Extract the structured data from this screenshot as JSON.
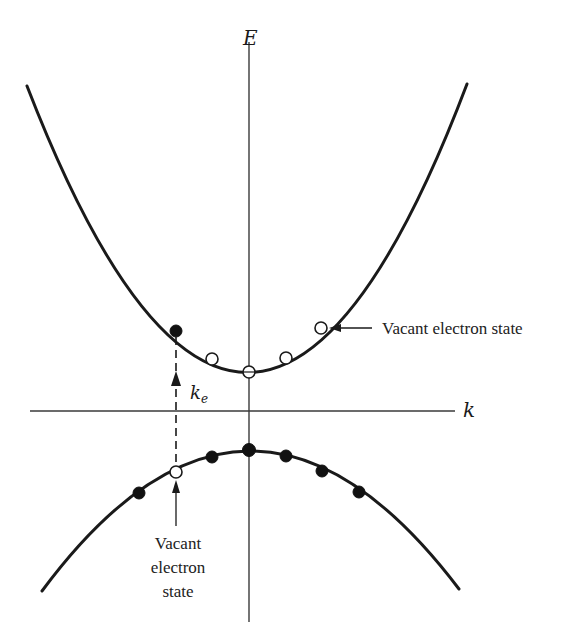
{
  "diagram": {
    "axes": {
      "vertical_label": "E",
      "horizontal_label": "k"
    },
    "wavevector_label": {
      "main": "k",
      "subscript": "e"
    },
    "annotations": {
      "upper_vacant": "Vacant electron state",
      "lower_vacant_line1": "Vacant",
      "lower_vacant_line2": "electron",
      "lower_vacant_line3": "state"
    },
    "conduction_band_points": [
      {
        "x": 176,
        "y": 331,
        "state": "filled"
      },
      {
        "x": 212,
        "y": 359,
        "state": "vacant"
      },
      {
        "x": 249,
        "y": 372,
        "state": "vacant"
      },
      {
        "x": 286,
        "y": 358,
        "state": "vacant"
      },
      {
        "x": 321,
        "y": 328,
        "state": "vacant"
      }
    ],
    "valence_band_points": [
      {
        "x": 139,
        "y": 493,
        "state": "filled"
      },
      {
        "x": 176,
        "y": 472,
        "state": "vacant"
      },
      {
        "x": 212,
        "y": 457,
        "state": "filled"
      },
      {
        "x": 249,
        "y": 450,
        "state": "filled"
      },
      {
        "x": 286,
        "y": 456,
        "state": "filled"
      },
      {
        "x": 322,
        "y": 471,
        "state": "filled"
      },
      {
        "x": 359,
        "y": 492,
        "state": "filled"
      }
    ],
    "colors": {
      "line": "#1a1a1a",
      "axis": "#3a3a3a",
      "background": "#ffffff"
    }
  }
}
